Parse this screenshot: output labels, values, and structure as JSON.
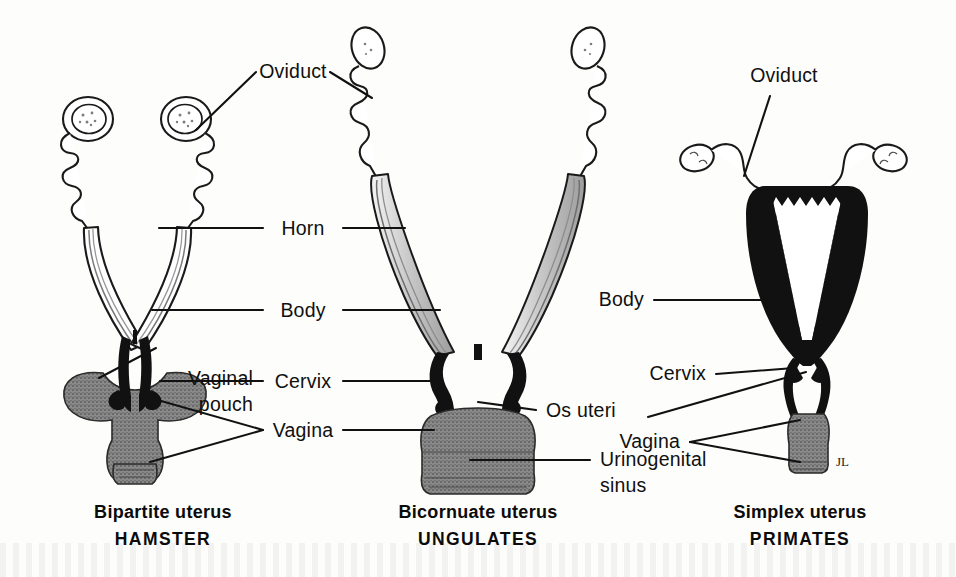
{
  "figure": {
    "kind": "comparative-anatomy-diagram",
    "background_color": "#fdfdfb",
    "ink_color": "#111111",
    "gray_fill_color": "#8a8a8a"
  },
  "panels": [
    {
      "id": "hamster",
      "position": "left",
      "caption_line1": "Bipartite uterus",
      "caption_line2": "HAMSTER",
      "structures": [
        "ovary",
        "oviduct",
        "horn",
        "body",
        "cervix",
        "vaginal pouch",
        "vagina"
      ]
    },
    {
      "id": "ungulates",
      "position": "center",
      "caption_line1": "Bicornuate uterus",
      "caption_line2": "UNGULATES",
      "structures": [
        "ovary",
        "oviduct",
        "horn",
        "body",
        "cervix",
        "os uteri",
        "vagina",
        "urinogenital sinus"
      ]
    },
    {
      "id": "primates",
      "position": "right",
      "caption_line1": "Simplex uterus",
      "caption_line2": "PRIMATES",
      "structures": [
        "ovary",
        "oviduct",
        "body",
        "cervix",
        "os uteri",
        "vagina"
      ]
    }
  ],
  "labels": {
    "oviduct_center": "Oviduct",
    "horn": "Horn",
    "body_center": "Body",
    "cervix_center": "Cervix",
    "vagina_center": "Vagina",
    "vaginal_pouch_line1": "Vaginal",
    "vaginal_pouch_line2": "pouch",
    "os_uteri": "Os uteri",
    "urinogenital_line1": "Urinogenital",
    "urinogenital_line2": "sinus",
    "oviduct_right": "Oviduct",
    "body_right": "Body",
    "cervix_right": "Cervix",
    "vagina_right": "Vagina",
    "signature": "JL"
  }
}
